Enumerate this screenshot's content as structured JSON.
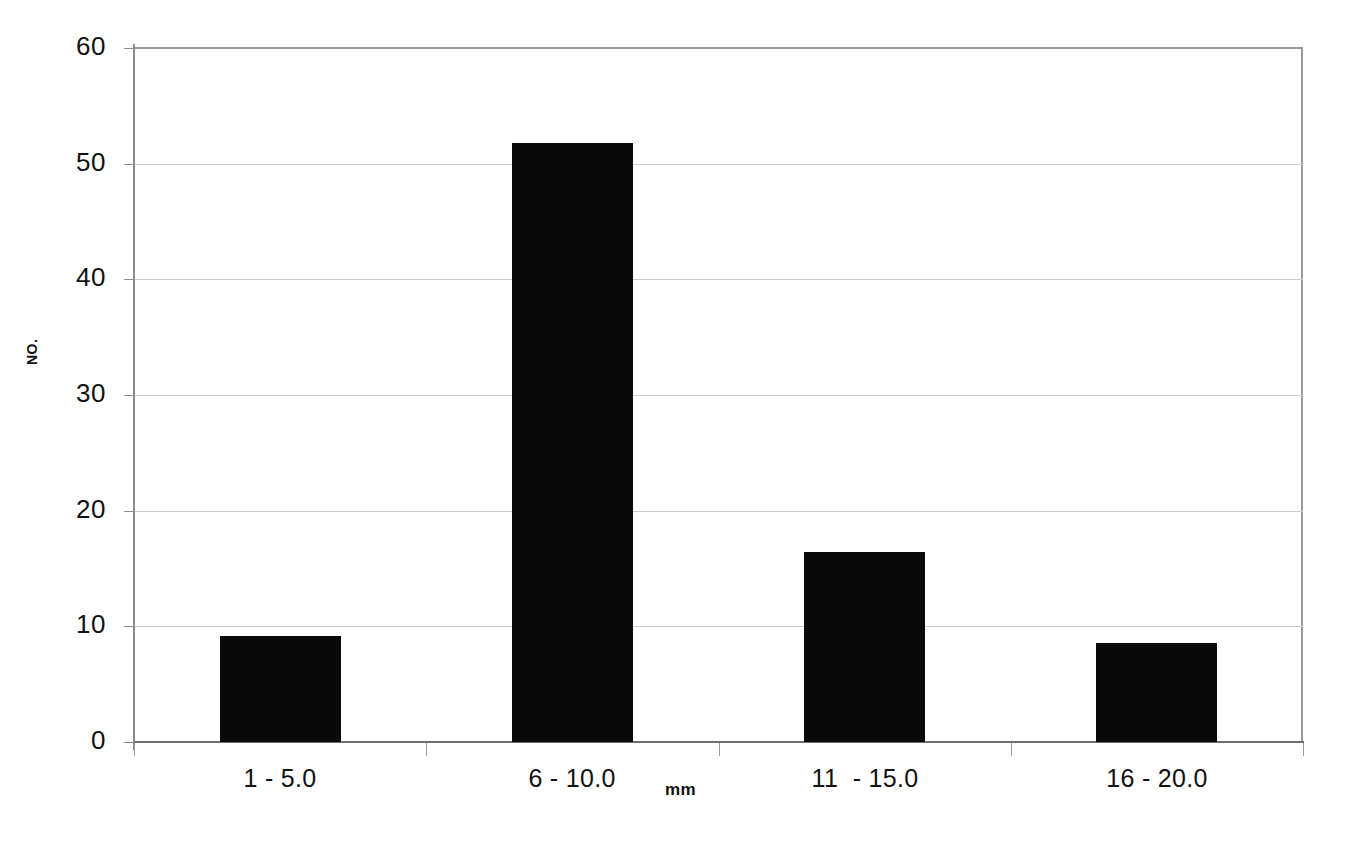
{
  "chart_data": {
    "type": "bar",
    "title": "",
    "subtitle": "",
    "xlabel": "mm",
    "ylabel": "NO.",
    "categories": [
      "1 - 5.0",
      "6 - 10.0",
      "11  - 15.0",
      "16 - 20.0"
    ],
    "values": [
      9.2,
      51.8,
      16.4,
      8.6
    ],
    "ylim": [
      0,
      60
    ],
    "ytick_labels": [
      "60",
      "50",
      "40",
      "30",
      "20",
      "10",
      "0"
    ],
    "ytick_values": [
      60,
      50,
      40,
      30,
      20,
      10,
      0
    ],
    "grid": true,
    "grid_axis": "y",
    "legend": false,
    "legend_position": "none",
    "bar_color": "#0a0a0a",
    "grid_color": "#c9c9c9",
    "axis_color": "#8c8c8c",
    "background_color": "#ffffff"
  }
}
